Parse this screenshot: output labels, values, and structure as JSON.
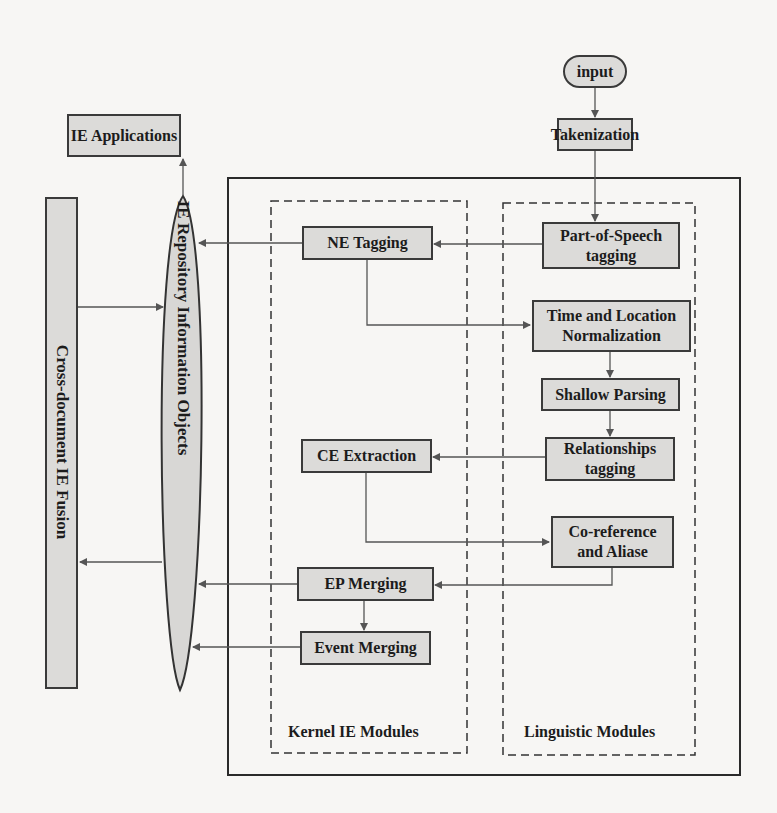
{
  "diagram": {
    "nodes": {
      "input": "input",
      "tokenization": "Takenization",
      "ie_applications": "IE Applications",
      "ne_tagging": "NE Tagging",
      "pos_tagging_line1": "Part-of-Speech",
      "pos_tagging_line2": "tagging",
      "time_location_line1": "Time and Location",
      "time_location_line2": "Normalization",
      "shallow_parsing": "Shallow Parsing",
      "relationships_line1": "Relationships",
      "relationships_line2": "tagging",
      "ce_extraction": "CE Extraction",
      "coref_line1": "Co-reference",
      "coref_line2": "and Aliase",
      "ep_merging": "EP Merging",
      "event_merging": "Event Merging",
      "cross_document": "Cross-document IE Fusion",
      "repository": "IE Repository Information Objects"
    },
    "groups": {
      "kernel": "Kernel IE Modules",
      "linguistic": "Linguistic Modules"
    },
    "edges": [
      {
        "from": "input",
        "to": "tokenization"
      },
      {
        "from": "tokenization",
        "to": "pos_tagging"
      },
      {
        "from": "pos_tagging",
        "to": "ne_tagging"
      },
      {
        "from": "ne_tagging",
        "to": "repository"
      },
      {
        "from": "ne_tagging",
        "to": "time_location"
      },
      {
        "from": "time_location",
        "to": "shallow_parsing"
      },
      {
        "from": "shallow_parsing",
        "to": "relationships"
      },
      {
        "from": "relationships",
        "to": "ce_extraction"
      },
      {
        "from": "ce_extraction",
        "to": "coref"
      },
      {
        "from": "coref",
        "to": "ep_merging"
      },
      {
        "from": "ep_merging",
        "to": "repository"
      },
      {
        "from": "ep_merging",
        "to": "event_merging"
      },
      {
        "from": "event_merging",
        "to": "repository"
      },
      {
        "from": "repository",
        "to": "ie_applications"
      },
      {
        "from": "cross_document",
        "to": "repository"
      },
      {
        "from": "repository",
        "to": "cross_document"
      }
    ],
    "colors": {
      "box_fill": "#dcdbd9",
      "stroke": "#3a3a3a",
      "background": "#f7f6f4"
    }
  }
}
